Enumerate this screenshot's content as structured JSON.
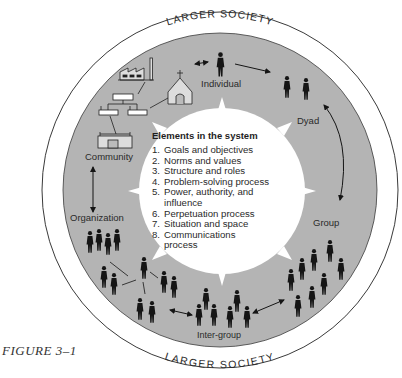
{
  "figure": {
    "caption": "FIGURE 3–1",
    "outer_ring_label_top": "LARGER SOCIETY",
    "outer_ring_label_bottom": "LARGER SOCIETY"
  },
  "levels": [
    {
      "id": "individual",
      "label": "Individual"
    },
    {
      "id": "dyad",
      "label": "Dyad"
    },
    {
      "id": "group",
      "label": "Group"
    },
    {
      "id": "inter-group",
      "label": "Inter-group"
    },
    {
      "id": "organization",
      "label": "Organization"
    },
    {
      "id": "community",
      "label": "Community"
    }
  ],
  "elements_panel": {
    "title": "Elements in the system",
    "items": [
      {
        "n": "1.",
        "text": "Goals and objectives"
      },
      {
        "n": "2.",
        "text": "Norms and values"
      },
      {
        "n": "3.",
        "text": "Structure and roles"
      },
      {
        "n": "4.",
        "text": "Problem-solving process"
      },
      {
        "n": "5.",
        "text": "Power, authority, and influence"
      },
      {
        "n": "6.",
        "text": "Perpetuation process"
      },
      {
        "n": "7.",
        "text": "Situation and space"
      },
      {
        "n": "8.",
        "text": "Communications process"
      }
    ]
  },
  "colors": {
    "ring_gray": "#b4b4b4",
    "outline": "#3a3a3a",
    "figure": "#151515",
    "background": "#ffffff"
  }
}
